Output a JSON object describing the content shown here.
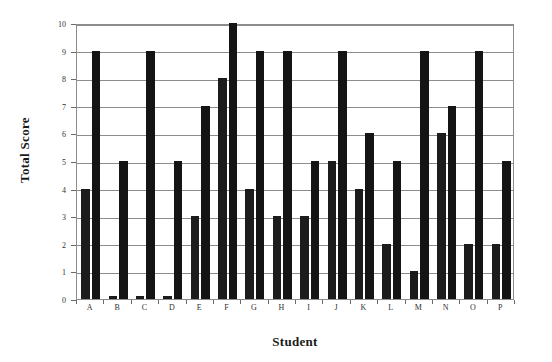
{
  "chart_data": {
    "type": "bar",
    "title": "",
    "subtitle": "",
    "xlabel": "Student",
    "ylabel": "Total Score",
    "categories": [
      "A",
      "B",
      "C",
      "D",
      "E",
      "F",
      "G",
      "H",
      "I",
      "J",
      "K",
      "L",
      "M",
      "N",
      "O",
      "P"
    ],
    "series": [
      {
        "name": "Series 1",
        "color": "#1c1c1c",
        "values": [
          4,
          0.1,
          0.1,
          0.1,
          3,
          8,
          4,
          3,
          3,
          5,
          4,
          2,
          1,
          6,
          2,
          2
        ]
      },
      {
        "name": "Series 2",
        "color": "#141414",
        "values": [
          9,
          5,
          9,
          5,
          7,
          10,
          9,
          9,
          5,
          9,
          6,
          5,
          9,
          7,
          9,
          5
        ]
      }
    ],
    "ylim": [
      0,
      10
    ],
    "yticks": [
      0,
      1,
      2,
      3,
      4,
      5,
      6,
      7,
      8,
      9,
      10
    ],
    "ytick_labels": [
      "0",
      "1",
      "2",
      "3",
      "4",
      "5",
      "6",
      "7",
      "8",
      "9",
      "10"
    ],
    "xtick_labels": [
      "A",
      "B",
      "C",
      "D",
      "E",
      "F",
      "G",
      "H",
      "I",
      "J",
      "K",
      "L",
      "M",
      "N",
      "O",
      "P"
    ],
    "grid": "horizontal",
    "legend": "none",
    "legend_position": "none",
    "annotations": [],
    "frame": "box",
    "bar_color": "#1c1c1c",
    "background": "#ffffff",
    "axis_color": "#8c8c8c"
  },
  "axes": {
    "y_title": "Total Score",
    "x_title": "Student"
  }
}
